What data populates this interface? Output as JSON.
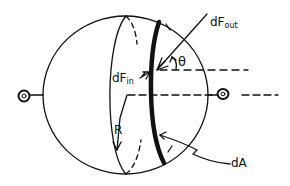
{
  "diagram": {
    "labels": {
      "dF_out": {
        "main": "dF",
        "sub": "out"
      },
      "dF_in": {
        "main": "dF",
        "sub": "in"
      },
      "theta": "θ",
      "R": "R",
      "dA": "dA"
    },
    "colors": {
      "stroke": "#111111",
      "background": "#ffffff"
    }
  }
}
